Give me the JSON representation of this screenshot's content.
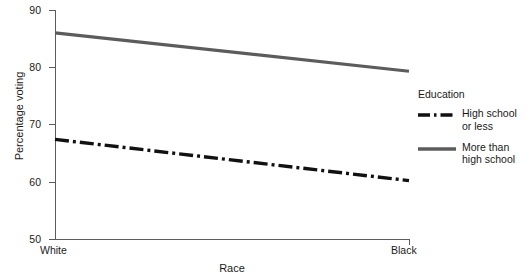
{
  "chart_data": {
    "type": "line",
    "title": "",
    "xlabel": "Race",
    "ylabel": "Percentage voting",
    "categories": [
      "White",
      "Black"
    ],
    "x": [
      0,
      1
    ],
    "xlim": [
      0,
      1
    ],
    "ylim": [
      50,
      90
    ],
    "yticks": [
      50,
      60,
      70,
      80,
      90
    ],
    "ytick_labels": [
      "50",
      "60",
      "70",
      "80",
      "90"
    ],
    "xtick_labels": [
      "White",
      "Black"
    ],
    "grid": false,
    "legend_position": "right",
    "legend_title": "Education",
    "series": [
      {
        "name": "High school or less",
        "values": [
          67.4,
          60.2
        ],
        "color": "#111111",
        "linestyle": "dashdot",
        "linewidth": 3.2
      },
      {
        "name": "More than high school",
        "values": [
          86.0,
          79.3
        ],
        "color": "#5c5c5c",
        "linestyle": "solid",
        "linewidth": 3.2
      }
    ]
  },
  "axes": {
    "y_title": "Percentage voting",
    "x_title": "Race",
    "y_ticks": [
      {
        "label": "90",
        "value": 90
      },
      {
        "label": "80",
        "value": 80
      },
      {
        "label": "70",
        "value": 70
      },
      {
        "label": "60",
        "value": 60
      },
      {
        "label": "50",
        "value": 50
      }
    ],
    "x_ticks": [
      {
        "label": "White"
      },
      {
        "label": "Black"
      }
    ]
  },
  "legend": {
    "title": "Education",
    "entries": [
      {
        "label_line1": "High school",
        "label_line2": "or less",
        "style": "dashdot",
        "color": "#111111"
      },
      {
        "label_line1": "More than",
        "label_line2": "high school",
        "style": "solid",
        "color": "#5c5c5c"
      }
    ]
  },
  "colors": {
    "axis": "#5c5c5c",
    "text": "#1a1a1a",
    "series_hs_or_less": "#111111",
    "series_more_than_hs": "#5c5c5c",
    "background": "#ffffff"
  }
}
